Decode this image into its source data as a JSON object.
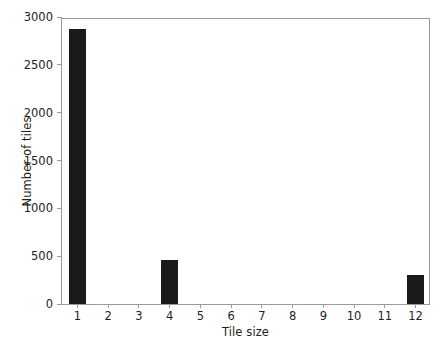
{
  "chart_data": {
    "type": "bar",
    "title": "",
    "xlabel": "Tile size",
    "ylabel": "Number of tiles",
    "categories": [
      "1",
      "2",
      "3",
      "4",
      "5",
      "6",
      "7",
      "8",
      "9",
      "10",
      "11",
      "12"
    ],
    "values": [
      2870,
      0,
      0,
      455,
      0,
      0,
      0,
      0,
      0,
      0,
      0,
      300
    ],
    "series": [
      {
        "name": "Number of tiles",
        "values": [
          2870,
          0,
          0,
          455,
          0,
          0,
          0,
          0,
          0,
          0,
          0,
          300
        ]
      }
    ],
    "ylim": [
      0,
      3000
    ],
    "yticks": [
      0,
      500,
      1000,
      1500,
      2000,
      2500,
      3000
    ],
    "yticklabels": [
      "0",
      "500",
      "1000",
      "1500",
      "2000",
      "2500",
      "3000"
    ],
    "xticklabels": [
      "1",
      "2",
      "3",
      "4",
      "5",
      "6",
      "7",
      "8",
      "9",
      "10",
      "11",
      "12"
    ],
    "grid": false,
    "legend": false,
    "legend_position": "none",
    "bar_color": "#1a1a1a",
    "axis_color": "#9a9a9a",
    "background_color": "#ffffff",
    "text_color": "#231f20"
  }
}
